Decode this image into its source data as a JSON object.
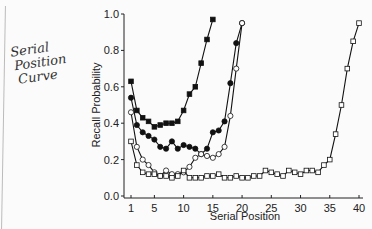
{
  "annotation": {
    "lines": [
      "Serial",
      "Position",
      "Curve"
    ]
  },
  "chart_data": {
    "type": "line",
    "title": "",
    "xlabel": "Serial Position",
    "ylabel": "Recall Probability",
    "xlim": [
      1,
      40
    ],
    "ylim": [
      0.0,
      1.0
    ],
    "xticks": [
      1,
      5,
      10,
      15,
      20,
      25,
      30,
      35,
      40
    ],
    "xtick_labels": [
      "1",
      "5",
      "10",
      "15",
      "20",
      "25",
      "30",
      "35",
      "40"
    ],
    "yticks": [
      0.0,
      0.2,
      0.4,
      0.6,
      0.8,
      1.0
    ],
    "ytick_labels": [
      "0.0",
      "0.2",
      "0.4",
      "0.6",
      "0.8",
      "1.0"
    ],
    "grid": false,
    "series": [
      {
        "name": "list-15",
        "marker": "filled-square",
        "values": [
          0.63,
          0.47,
          0.43,
          0.41,
          0.38,
          0.39,
          0.4,
          0.4,
          0.41,
          0.47,
          0.56,
          0.6,
          0.73,
          0.86,
          0.97
        ]
      },
      {
        "name": "list-20-a",
        "marker": "filled-circle",
        "values": [
          0.54,
          0.39,
          0.35,
          0.33,
          0.31,
          0.27,
          0.26,
          0.3,
          0.26,
          0.28,
          0.27,
          0.26,
          0.23,
          0.26,
          0.35,
          0.36,
          0.41,
          0.62,
          0.84,
          0.95
        ]
      },
      {
        "name": "list-20-b",
        "marker": "open-circle",
        "values": [
          0.46,
          0.27,
          0.2,
          0.17,
          0.13,
          0.11,
          0.14,
          0.12,
          0.12,
          0.13,
          0.16,
          0.21,
          0.23,
          0.22,
          0.21,
          0.23,
          0.27,
          0.44,
          0.7,
          0.95
        ]
      },
      {
        "name": "list-40",
        "marker": "open-square",
        "values": [
          0.3,
          0.17,
          0.13,
          0.12,
          0.12,
          0.11,
          0.11,
          0.1,
          0.11,
          0.14,
          0.1,
          0.1,
          0.1,
          0.11,
          0.11,
          0.12,
          0.1,
          0.1,
          0.11,
          0.1,
          0.1,
          0.11,
          0.11,
          0.14,
          0.13,
          0.12,
          0.11,
          0.14,
          0.13,
          0.12,
          0.14,
          0.14,
          0.13,
          0.17,
          0.2,
          0.34,
          0.5,
          0.7,
          0.85,
          0.95
        ]
      }
    ]
  }
}
